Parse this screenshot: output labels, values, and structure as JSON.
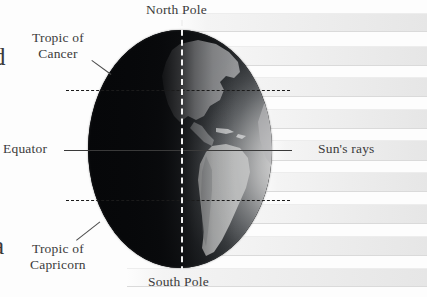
{
  "figure": {
    "type": "earth-illumination-diagram"
  },
  "labels": {
    "north_pole": "North Pole",
    "south_pole": "South Pole",
    "equator": "Equator",
    "suns_rays": "Sun's rays",
    "tropic_of_cancer": "Tropic of\nCancer",
    "tropic_of_capricorn": "Tropic of\nCapricorn"
  },
  "edge_text": {
    "top_fragment": "d",
    "bottom_fragment": "a"
  },
  "globe": {
    "axis_label": "polar-axis",
    "lines": [
      {
        "name": "tropic-of-cancer",
        "style": "dashed"
      },
      {
        "name": "equator",
        "style": "solid"
      },
      {
        "name": "tropic-of-capricorn",
        "style": "dashed"
      },
      {
        "name": "polar-axis",
        "style": "dashed-vertical"
      }
    ]
  },
  "rays": {
    "count": 9,
    "direction": "horizontal-from-right"
  },
  "colors": {
    "background": "#fdfdfd",
    "night_side": "#0a0b0d",
    "day_side": "#c9cacb",
    "ray_band": "#ededed",
    "text": "#3b3b3b",
    "axis_dash": "#f2f2f2",
    "equator_line": "#3a3a3a"
  }
}
